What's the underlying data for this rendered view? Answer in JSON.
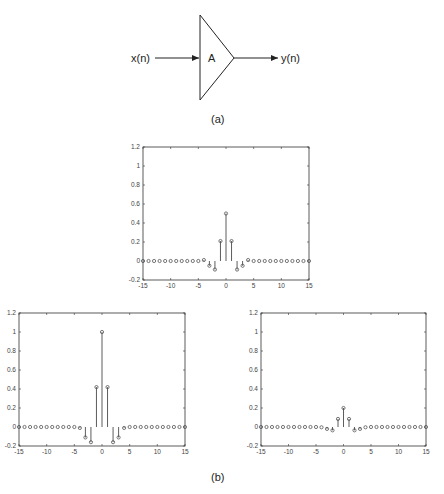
{
  "diagram": {
    "input_label": "x(n)",
    "gain_label": "A",
    "output_label": "y(n)",
    "caption_a": "(a)",
    "caption_b": "(b)"
  },
  "chart_data": [
    {
      "type": "stem",
      "position": "top-center",
      "x": [
        -15,
        -14,
        -13,
        -12,
        -11,
        -10,
        -9,
        -8,
        -7,
        -6,
        -5,
        -4,
        -3,
        -2,
        -1,
        0,
        1,
        2,
        3,
        4,
        5,
        6,
        7,
        8,
        9,
        10,
        11,
        12,
        13,
        14,
        15
      ],
      "values": [
        0,
        0,
        0,
        0,
        0,
        0,
        0,
        0,
        0,
        0,
        0,
        0.01,
        -0.05,
        -0.09,
        0.21,
        0.5,
        0.21,
        -0.09,
        -0.05,
        0.01,
        0,
        0,
        0,
        0,
        0,
        0,
        0,
        0,
        0,
        0,
        0
      ],
      "xlim": [
        -15,
        15
      ],
      "ylim": [
        -0.2,
        1.2
      ],
      "xticks": [
        -15,
        -10,
        -5,
        0,
        5,
        10,
        15
      ],
      "yticks": [
        -0.2,
        0,
        0.2,
        0.4,
        0.6,
        0.8,
        1,
        1.2
      ],
      "xlabel": "",
      "ylabel": "",
      "title": "",
      "grid": false
    },
    {
      "type": "stem",
      "position": "bottom-left",
      "x": [
        -15,
        -14,
        -13,
        -12,
        -11,
        -10,
        -9,
        -8,
        -7,
        -6,
        -5,
        -4,
        -3,
        -2,
        -1,
        0,
        1,
        2,
        3,
        4,
        5,
        6,
        7,
        8,
        9,
        10,
        11,
        12,
        13,
        14,
        15
      ],
      "values": [
        0,
        0,
        0,
        0,
        0,
        0,
        0,
        0,
        0,
        0,
        0,
        -0.01,
        -0.11,
        -0.16,
        0.42,
        1.0,
        0.42,
        -0.16,
        -0.11,
        -0.01,
        0,
        0,
        0,
        0,
        0,
        0,
        0,
        0,
        0,
        0,
        0
      ],
      "xlim": [
        -15,
        15
      ],
      "ylim": [
        -0.2,
        1.2
      ],
      "xticks": [
        -15,
        -10,
        -5,
        0,
        5,
        10,
        15
      ],
      "yticks": [
        -0.2,
        0,
        0.2,
        0.4,
        0.6,
        0.8,
        1,
        1.2
      ],
      "xlabel": "",
      "ylabel": "",
      "title": "",
      "grid": false
    },
    {
      "type": "stem",
      "position": "bottom-right",
      "x": [
        -15,
        -14,
        -13,
        -12,
        -11,
        -10,
        -9,
        -8,
        -7,
        -6,
        -5,
        -4,
        -3,
        -2,
        -1,
        0,
        1,
        2,
        3,
        4,
        5,
        6,
        7,
        8,
        9,
        10,
        11,
        12,
        13,
        14,
        15
      ],
      "values": [
        0,
        0,
        0,
        0,
        0,
        0,
        0,
        0,
        0,
        0,
        0,
        -0.003,
        -0.02,
        -0.035,
        0.085,
        0.2,
        0.085,
        -0.035,
        -0.02,
        -0.003,
        0,
        0,
        0,
        0,
        0,
        0,
        0,
        0,
        0,
        0,
        0
      ],
      "xlim": [
        -15,
        15
      ],
      "ylim": [
        -0.2,
        1.2
      ],
      "xticks": [
        -15,
        -10,
        -5,
        0,
        5,
        10,
        15
      ],
      "yticks": [
        -0.2,
        0,
        0.2,
        0.4,
        0.6,
        0.8,
        1,
        1.2
      ],
      "xlabel": "",
      "ylabel": "",
      "title": "",
      "grid": false
    }
  ],
  "layout": {
    "plots": [
      {
        "left": 143,
        "top": 147,
        "right": 309,
        "bottom": 280
      },
      {
        "left": 19,
        "top": 313,
        "right": 185,
        "bottom": 446
      },
      {
        "left": 261,
        "top": 313,
        "right": 426,
        "bottom": 446
      }
    ],
    "colors": {
      "stroke": "#333333",
      "marker": "#555555"
    }
  }
}
